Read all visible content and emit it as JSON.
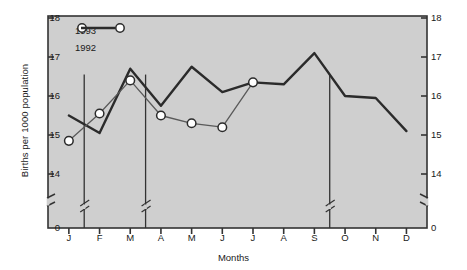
{
  "chart_data": {
    "type": "line",
    "title": "",
    "xlabel": "Months",
    "ylabel": "Births per 1000 population",
    "categories": [
      "J",
      "F",
      "M",
      "A",
      "M",
      "J",
      "J",
      "A",
      "S",
      "O",
      "N",
      "D"
    ],
    "category_full": [
      "January",
      "February",
      "March",
      "April",
      "May",
      "June",
      "July",
      "August",
      "September",
      "October",
      "November",
      "December"
    ],
    "ylim": [
      14,
      18
    ],
    "yticks": [
      "0",
      "14",
      "15",
      "16",
      "17",
      "18"
    ],
    "y_axis_broken": true,
    "y_axis_break_note": "axis break between 0 and 14",
    "grid": false,
    "legend_position": "upper-left-inside",
    "series": [
      {
        "name": "1993",
        "marker": "open-circle",
        "values": [
          14.85,
          15.55,
          16.4,
          15.5,
          15.3,
          15.2,
          16.35,
          null,
          null,
          null,
          null,
          null
        ]
      },
      {
        "name": "1992",
        "marker": "none",
        "values": [
          15.5,
          15.05,
          16.7,
          15.75,
          16.75,
          16.1,
          16.35,
          16.3,
          17.1,
          16.0,
          15.95,
          15.1
        ]
      }
    ]
  },
  "legend": {
    "items": [
      {
        "label": "1993",
        "style": "circle-line-circle"
      },
      {
        "label": "1992",
        "style": "solid-line"
      }
    ]
  },
  "axes": {
    "y_left_ticks": [
      "18",
      "17",
      "16",
      "15",
      "14",
      "0"
    ],
    "y_right_ticks": [
      "18",
      "17",
      "16",
      "15",
      "14",
      "0"
    ],
    "x_ticks": [
      "J",
      "F",
      "M",
      "A",
      "M",
      "J",
      "J",
      "A",
      "S",
      "O",
      "N",
      "D"
    ],
    "x_title": "Months",
    "y_title": "Births per 1000 population"
  },
  "colors": {
    "plot_background": "#cfcfcf",
    "line_1992": "#2b2b2b",
    "line_1993": "#5a5a5a",
    "marker_fill": "#ffffff",
    "axis": "#333333",
    "text": "#1a1a1a",
    "page_background": "#ffffff"
  },
  "dividers": {
    "description": "vertical quarter separator lines with axis-break marks",
    "after_months": [
      "M",
      "J",
      "S"
    ]
  }
}
